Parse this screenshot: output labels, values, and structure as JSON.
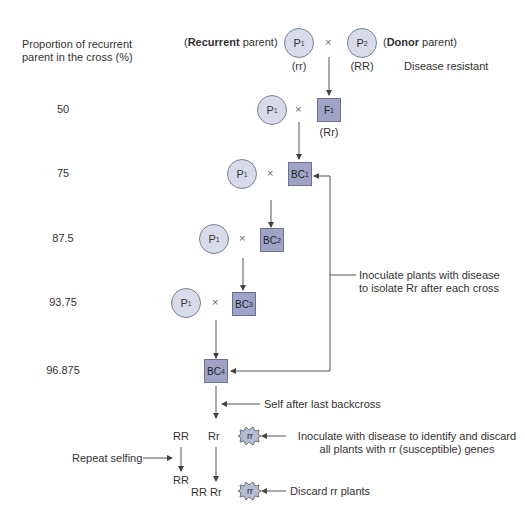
{
  "axis": {
    "title_line1": "Proportion of recurrent",
    "title_line2": "parent in the cross (%)",
    "values": [
      "50",
      "75",
      "87.5",
      "93.75",
      "96.875"
    ]
  },
  "parents": {
    "recurrent_label_bold": "Recurrent",
    "recurrent_label_rest": " parent)",
    "recurrent_open": "(",
    "p1": "P",
    "p1_sub": "1",
    "p1_genotype": "(rr)",
    "donor_open": "(",
    "donor_label_bold": "Donor",
    "donor_label_rest": " parent)",
    "p2": "P",
    "p2_sub": "2",
    "p2_genotype": "(RR)",
    "trait": "Disease resistant",
    "cross_symbol": "×"
  },
  "generations": [
    {
      "name": "F",
      "sub": "1",
      "genotype": "(Rr)"
    },
    {
      "name": "BC",
      "sub": "1"
    },
    {
      "name": "BC",
      "sub": "2"
    },
    {
      "name": "BC",
      "sub": "3"
    },
    {
      "name": "BC",
      "sub": "4"
    }
  ],
  "annotations": {
    "inoculate_line1": "Inoculate plants with disease",
    "inoculate_line2": "to isolate Rr after each cross",
    "self": "Self after last backcross",
    "identify_line1": "Inoculate with disease to identify and discard",
    "identify_line2": "all plants with rr (susceptible) genes",
    "repeat": "Repeat selfing",
    "discard": "Discard rr plants"
  },
  "offspring": {
    "row1": [
      "RR",
      "Rr",
      "rr"
    ],
    "row2_left": "RR",
    "row2_mid": "RR Rr",
    "row2_burst": "rr"
  },
  "colors": {
    "circle_fill": "#d7dbea",
    "box_fill": "#9ea3c7",
    "line": "#555555"
  }
}
